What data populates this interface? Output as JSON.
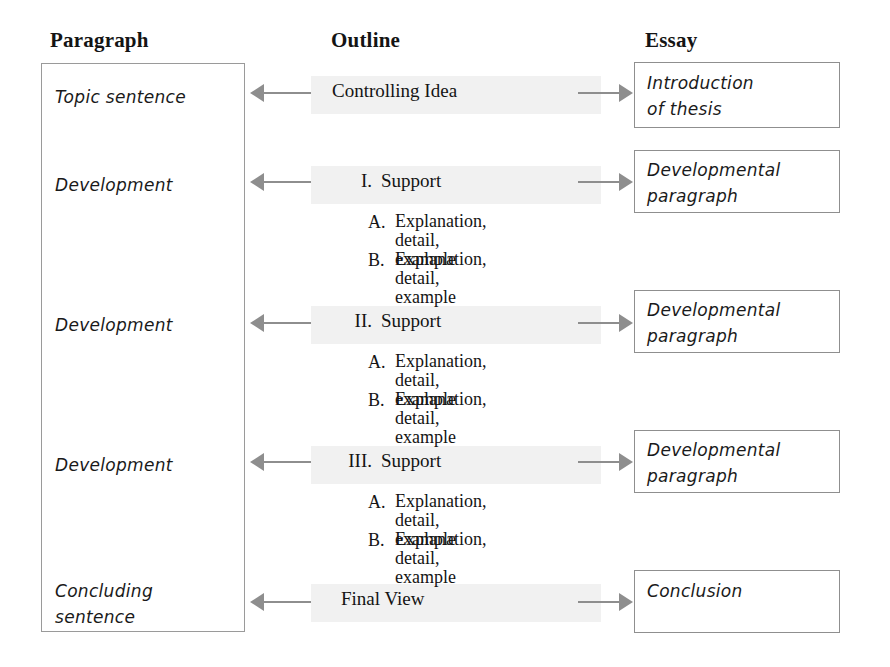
{
  "headers": {
    "paragraph": "Paragraph",
    "outline": "Outline",
    "essay": "Essay"
  },
  "colors": {
    "arrow": "#8e8e8e",
    "box_border": "#919191",
    "band": "#f1f1f1",
    "text": "#141414"
  },
  "paragraph_column": {
    "items": [
      {
        "label": "Topic sentence",
        "top": 84
      },
      {
        "label": "Development",
        "top": 172
      },
      {
        "label": "Development",
        "top": 312
      },
      {
        "label": "Development",
        "top": 452
      },
      {
        "label": "Concluding\nsentence",
        "top": 578
      }
    ]
  },
  "outline_column": {
    "rows": [
      {
        "numeral": "",
        "label": "Controlling Idea",
        "top": 80,
        "label_left": 332
      },
      {
        "numeral": "I.",
        "label": "Support",
        "top": 170,
        "label_left": 375
      },
      {
        "numeral": "II.",
        "label": "Support",
        "top": 310,
        "label_left": 375
      },
      {
        "numeral": "III.",
        "label": "Support",
        "top": 450,
        "label_left": 375
      },
      {
        "numeral": "",
        "label": "Final View",
        "top": 588,
        "label_left": 341
      }
    ],
    "sub_groups": [
      {
        "top": 212,
        "items": [
          {
            "letter": "A.",
            "text": "Explanation,\ndetail, example"
          },
          {
            "letter": "B.",
            "text": "Explanation,\ndetail, example"
          }
        ]
      },
      {
        "top": 352,
        "items": [
          {
            "letter": "A.",
            "text": "Explanation,\ndetail, example"
          },
          {
            "letter": "B.",
            "text": "Explanation,\ndetail, example"
          }
        ]
      },
      {
        "top": 492,
        "items": [
          {
            "letter": "A.",
            "text": "Explanation,\ndetail, example"
          },
          {
            "letter": "B.",
            "text": "Explanation,\ndetail, example"
          }
        ]
      }
    ]
  },
  "essay_column": {
    "boxes": [
      {
        "label": "Introduction\nof thesis",
        "top": 62,
        "height": 66
      },
      {
        "label": "Developmental\nparagraph",
        "top": 150,
        "height": 63
      },
      {
        "label": "Developmental\nparagraph",
        "top": 290,
        "height": 63
      },
      {
        "label": "Developmental\nparagraph",
        "top": 430,
        "height": 63
      },
      {
        "label": "Conclusion",
        "top": 570,
        "height": 63
      }
    ]
  },
  "arrows": {
    "left_arrows": [
      {
        "y": 93
      },
      {
        "y": 182
      },
      {
        "y": 323
      },
      {
        "y": 462
      },
      {
        "y": 602
      }
    ],
    "right_arrows": [
      {
        "y": 93
      },
      {
        "y": 182
      },
      {
        "y": 323
      },
      {
        "y": 462
      },
      {
        "y": 602
      }
    ]
  }
}
